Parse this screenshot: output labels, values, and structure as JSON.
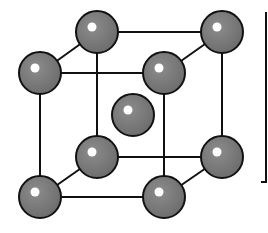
{
  "diagram": {
    "type": "bcc-unit-cell",
    "colors": {
      "background": "#ffffff",
      "bond": "#111111",
      "atom_fill": "#7a7a7a",
      "atom_stroke": "#111111",
      "highlight": "#ffffff"
    },
    "atom_radius": 21,
    "atoms": [
      {
        "id": "back-top-left",
        "x": 97,
        "y": 32
      },
      {
        "id": "back-top-right",
        "x": 222,
        "y": 32
      },
      {
        "id": "back-bottom-left",
        "x": 97,
        "y": 157
      },
      {
        "id": "back-bottom-right",
        "x": 222,
        "y": 157
      },
      {
        "id": "body-center",
        "x": 133,
        "y": 115
      },
      {
        "id": "front-top-left",
        "x": 40,
        "y": 73
      },
      {
        "id": "front-top-right",
        "x": 164,
        "y": 73
      },
      {
        "id": "front-bottom-left",
        "x": 40,
        "y": 197
      },
      {
        "id": "front-bottom-right",
        "x": 164,
        "y": 197
      }
    ],
    "edges": [
      [
        "back-top-left",
        "back-top-right"
      ],
      [
        "back-top-left",
        "back-bottom-left"
      ],
      [
        "back-top-right",
        "back-bottom-right"
      ],
      [
        "back-bottom-left",
        "back-bottom-right"
      ],
      [
        "front-top-left",
        "front-top-right"
      ],
      [
        "front-top-left",
        "front-bottom-left"
      ],
      [
        "front-top-right",
        "front-bottom-right"
      ],
      [
        "front-bottom-left",
        "front-bottom-right"
      ],
      [
        "front-top-left",
        "back-top-left"
      ],
      [
        "front-top-right",
        "back-top-right"
      ],
      [
        "front-bottom-left",
        "back-bottom-left"
      ],
      [
        "front-bottom-right",
        "back-bottom-right"
      ]
    ],
    "bracket": {
      "x": 266,
      "y1": 12,
      "y2": 182,
      "tick": 5
    }
  }
}
